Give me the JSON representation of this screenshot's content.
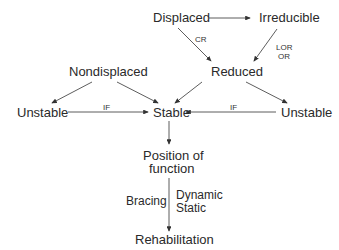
{
  "nodes": {
    "displaced": "Displaced",
    "irreducible": "Irreducible",
    "nondisplaced": "Nondisplaced",
    "reduced": "Reduced",
    "unstable_left": "Unstable",
    "stable": "Stable",
    "unstable_right": "Unstable",
    "position_line1": "Position of",
    "position_line2": "function",
    "rehabilitation": "Rehabilitation"
  },
  "edge_labels": {
    "cr": "CR",
    "lor": "LOR",
    "or": "OR",
    "if_left": "IF",
    "if_right": "IF",
    "bracing": "Bracing",
    "dynamic": "Dynamic",
    "static": "Static"
  }
}
